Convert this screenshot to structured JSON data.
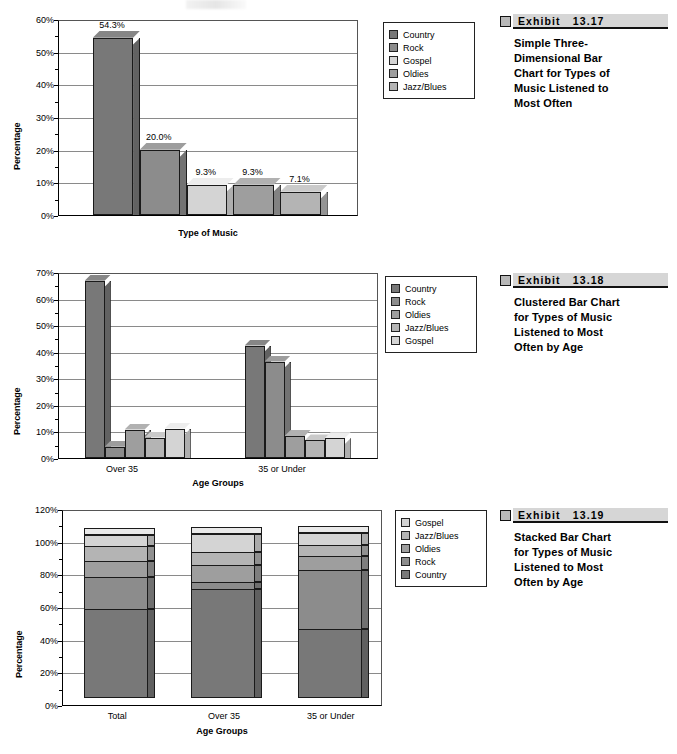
{
  "colors": {
    "country": "#787878",
    "rock": "#8c8c8c",
    "gospel": "#d4d4d4",
    "oldies": "#9e9e9e",
    "jazzblues": "#b4b4b4",
    "grid": "#8a8a8a",
    "axis": "#000000",
    "exhibit_bar": "#d6d6d6",
    "exhibit_square": "#b8b8b8"
  },
  "exhibits": [
    {
      "label": "Exhibit",
      "number": "13.17",
      "caption": "Simple Three-Dimensional Bar Chart for Types of Music Listened to Most Often",
      "caption_lines": [
        "Simple Three-",
        "Dimensional Bar",
        "Chart for Types of",
        "Music Listened to",
        "Most Often"
      ]
    },
    {
      "label": "Exhibit",
      "number": "13.18",
      "caption": "Clustered Bar Chart for Types of Music Listened to Most Often by Age",
      "caption_lines": [
        "Clustered Bar Chart",
        "for Types of Music",
        "Listened to Most",
        "Often by Age"
      ]
    },
    {
      "label": "Exhibit",
      "number": "13.19",
      "caption": "Stacked Bar Chart for Types of Music Listened to Most Often by Age",
      "caption_lines": [
        "Stacked Bar Chart",
        "for Types of Music",
        "Listened to Most",
        "Often by Age"
      ]
    }
  ],
  "chart_data": [
    {
      "id": "chart1",
      "type": "bar",
      "title": "",
      "xlabel": "Type of Music",
      "ylabel": "Percentage",
      "categories": [
        "Country",
        "Rock",
        "Gospel",
        "Oldies",
        "Jazz/Blues"
      ],
      "values": [
        54.3,
        20.0,
        9.3,
        9.3,
        7.1
      ],
      "data_labels": [
        "54.3%",
        "20.0%",
        "9.3%",
        "9.3%",
        "7.1%"
      ],
      "ylim": [
        0,
        60
      ],
      "yticks": [
        0,
        10,
        20,
        30,
        40,
        50,
        60
      ],
      "ytick_labels": [
        "0%",
        "10%",
        "20%",
        "30%",
        "40%",
        "50%",
        "60%"
      ],
      "grid": true,
      "legend_position": "right",
      "legend": [
        {
          "label": "Country",
          "color": "#787878"
        },
        {
          "label": "Rock",
          "color": "#8c8c8c"
        },
        {
          "label": "Gospel",
          "color": "#d4d4d4"
        },
        {
          "label": "Oldies",
          "color": "#9e9e9e"
        },
        {
          "label": "Jazz/Blues",
          "color": "#b4b4b4"
        }
      ]
    },
    {
      "id": "chart2",
      "type": "bar",
      "title": "",
      "xlabel": "Age Groups",
      "ylabel": "Percentage",
      "categories": [
        "Over 35",
        "35 or Under"
      ],
      "series": [
        {
          "name": "Country",
          "color": "#787878",
          "values": [
            66.7,
            42.3
          ]
        },
        {
          "name": "Rock",
          "color": "#8c8c8c",
          "values": [
            4.2,
            36.3
          ]
        },
        {
          "name": "Oldies",
          "color": "#9e9e9e",
          "values": [
            10.7,
            8.3
          ]
        },
        {
          "name": "Jazz/Blues",
          "color": "#b4b4b4",
          "values": [
            7.7,
            6.6
          ]
        },
        {
          "name": "Gospel",
          "color": "#d4d4d4",
          "values": [
            11.1,
            7.4
          ]
        }
      ],
      "ylim": [
        0,
        70
      ],
      "yticks": [
        0,
        10,
        20,
        30,
        40,
        50,
        60,
        70
      ],
      "ytick_labels": [
        "0%",
        "10%",
        "20%",
        "30%",
        "40%",
        "50%",
        "60%",
        "70%"
      ],
      "grid": true,
      "legend_position": "right",
      "legend": [
        {
          "label": "Country",
          "color": "#787878"
        },
        {
          "label": "Rock",
          "color": "#8c8c8c"
        },
        {
          "label": "Oldies",
          "color": "#9e9e9e"
        },
        {
          "label": "Jazz/Blues",
          "color": "#b4b4b4"
        },
        {
          "label": "Gospel",
          "color": "#d4d4d4"
        }
      ]
    },
    {
      "id": "chart3",
      "type": "bar",
      "stacked": true,
      "title": "",
      "xlabel": "Age Groups",
      "ylabel": "Percentage",
      "categories": [
        "Total",
        "Over 35",
        "35 or Under"
      ],
      "series": [
        {
          "name": "Country",
          "color": "#787878",
          "values": [
            54.3,
            66.7,
            42.3
          ]
        },
        {
          "name": "Rock",
          "color": "#8c8c8c",
          "values": [
            20.0,
            4.2,
            36.3
          ]
        },
        {
          "name": "Oldies",
          "color": "#9e9e9e",
          "values": [
            9.3,
            10.7,
            8.3
          ]
        },
        {
          "name": "Jazz/Blues",
          "color": "#b4b4b4",
          "values": [
            9.3,
            7.7,
            6.6
          ]
        },
        {
          "name": "Gospel",
          "color": "#d4d4d4",
          "values": [
            7.1,
            11.1,
            7.4
          ]
        }
      ],
      "ylim": [
        0,
        120
      ],
      "yticks": [
        0,
        20,
        40,
        60,
        80,
        100,
        120
      ],
      "ytick_labels": [
        "0%",
        "20%",
        "40%",
        "60%",
        "80%",
        "100%",
        "120%"
      ],
      "grid": true,
      "legend_position": "right",
      "legend": [
        {
          "label": "Gospel",
          "color": "#d4d4d4"
        },
        {
          "label": "Jazz/Blues",
          "color": "#b4b4b4"
        },
        {
          "label": "Oldies",
          "color": "#9e9e9e"
        },
        {
          "label": "Rock",
          "color": "#8c8c8c"
        },
        {
          "label": "Country",
          "color": "#787878"
        }
      ]
    }
  ]
}
